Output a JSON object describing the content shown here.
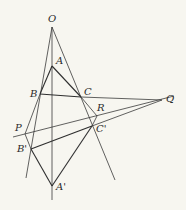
{
  "diagram": {
    "background": "#f7f6f0",
    "line_color": "#3a3a3a",
    "points": {
      "O": {
        "label": "O",
        "x": 52,
        "y": 27,
        "lx": 48,
        "ly": 22
      },
      "A": {
        "label": "A",
        "x": 52,
        "y": 66,
        "lx": 56,
        "ly": 64
      },
      "B": {
        "label": "B",
        "x": 40,
        "y": 94,
        "lx": 30,
        "ly": 97
      },
      "C": {
        "label": "C",
        "x": 81,
        "y": 97,
        "lx": 84,
        "ly": 95
      },
      "Q": {
        "label": "Q",
        "x": 162,
        "y": 100,
        "lx": 166,
        "ly": 102
      },
      "R": {
        "label": "R",
        "x": 97,
        "y": 116,
        "lx": 97,
        "ly": 111
      },
      "C_prime": {
        "label": "C'",
        "x": 92,
        "y": 126,
        "lx": 96,
        "ly": 132
      },
      "P": {
        "label": "P",
        "x": 25,
        "y": 134,
        "lx": 15,
        "ly": 131
      },
      "B_prime": {
        "label": "B'",
        "x": 31,
        "y": 149,
        "lx": 17,
        "ly": 152
      },
      "A_prime": {
        "label": "A'",
        "x": 52,
        "y": 186,
        "lx": 56,
        "ly": 190
      }
    },
    "triangles": [
      {
        "name": "ABC",
        "vertices": [
          "A",
          "B",
          "C"
        ]
      },
      {
        "name": "A'B'C'",
        "vertices": [
          "A'",
          "B'",
          "C'"
        ]
      }
    ],
    "concurrent_lines_through": "O",
    "collinear_points": [
      "P",
      "R",
      "Q"
    ]
  }
}
